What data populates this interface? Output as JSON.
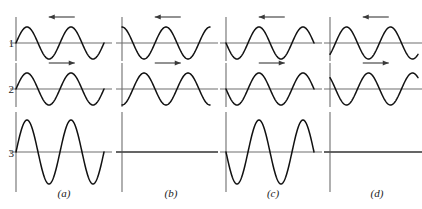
{
  "figure": {
    "row_labels": [
      "1",
      "2",
      "3"
    ],
    "column_labels": [
      "(a)",
      "(b)",
      "(c)",
      "(d)"
    ],
    "colors": {
      "wave_stroke": "#111111",
      "axis": "#6e6e6e",
      "arrow": "#3a3a3a",
      "background": "#ffffff"
    }
  },
  "chart_data": {
    "type": "line",
    "title": "",
    "xlabel": "",
    "ylabel": "",
    "grid": false,
    "legend": "none",
    "x": [
      0,
      720
    ],
    "xlim": [
      0,
      720
    ],
    "ylim": [
      -2,
      2
    ],
    "x_units": "degrees",
    "columns": [
      {
        "label": "(a)",
        "cycles": 2,
        "result": "constructive",
        "rows": [
          {
            "row": "1",
            "amplitude": 1,
            "phase_deg": 0,
            "direction": "left",
            "arrow": "left-arrow",
            "waveform": "sin"
          },
          {
            "row": "2",
            "amplitude": 1,
            "phase_deg": 0,
            "direction": "right",
            "arrow": "right-arrow",
            "waveform": "sin"
          },
          {
            "row": "3",
            "amplitude": 2,
            "phase_deg": 0,
            "direction": "none",
            "arrow": "none",
            "waveform": "sin"
          }
        ]
      },
      {
        "label": "(b)",
        "cycles": 2,
        "result": "destructive",
        "rows": [
          {
            "row": "1",
            "amplitude": 1,
            "phase_deg": 90,
            "direction": "left",
            "arrow": "left-arrow",
            "waveform": "sin"
          },
          {
            "row": "2",
            "amplitude": 1,
            "phase_deg": 270,
            "direction": "right",
            "arrow": "right-arrow",
            "waveform": "sin"
          },
          {
            "row": "3",
            "amplitude": 0,
            "phase_deg": 0,
            "direction": "none",
            "arrow": "none",
            "waveform": "flat"
          }
        ]
      },
      {
        "label": "(c)",
        "cycles": 2,
        "result": "constructive",
        "rows": [
          {
            "row": "1",
            "amplitude": 1,
            "phase_deg": 180,
            "direction": "left",
            "arrow": "left-arrow",
            "waveform": "sin"
          },
          {
            "row": "2",
            "amplitude": 1,
            "phase_deg": 180,
            "direction": "right",
            "arrow": "right-arrow",
            "waveform": "sin"
          },
          {
            "row": "3",
            "amplitude": 2,
            "phase_deg": 180,
            "direction": "none",
            "arrow": "none",
            "waveform": "sin"
          }
        ]
      },
      {
        "label": "(d)",
        "cycles": 2,
        "result": "destructive",
        "rows": [
          {
            "row": "1",
            "amplitude": 1,
            "phase_deg": 315,
            "direction": "left",
            "arrow": "left-arrow",
            "waveform": "sin"
          },
          {
            "row": "2",
            "amplitude": 1,
            "phase_deg": 135,
            "direction": "right",
            "arrow": "right-arrow",
            "waveform": "sin"
          },
          {
            "row": "3",
            "amplitude": 0,
            "phase_deg": 0,
            "direction": "none",
            "arrow": "none",
            "waveform": "flat"
          }
        ]
      }
    ]
  }
}
